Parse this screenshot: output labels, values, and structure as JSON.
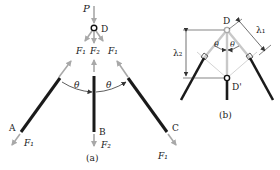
{
  "panel_a": {
    "caption": "(a)",
    "load_label": "P",
    "node_top": "D",
    "end_labels": [
      "A",
      "B",
      "C"
    ],
    "forces_top": [
      "F₁",
      "F₂",
      "F₁"
    ],
    "forces_bottom": [
      "F₁",
      "F₂",
      "F₁"
    ],
    "angle_labels": [
      "θ",
      "θ"
    ]
  },
  "panel_b": {
    "caption": "(b)",
    "node_top": "D",
    "node_bottom": "D'",
    "lambda_1": "λ₁",
    "lambda_2": "λ₂",
    "angle_labels": [
      "θ",
      "θ"
    ]
  },
  "colors": {
    "bar": "#1a1a1a",
    "arrow": "#a8a8a8",
    "ghost": "#c8c8c8",
    "text": "#222222"
  }
}
